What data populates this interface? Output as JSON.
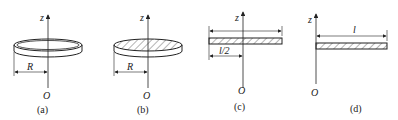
{
  "figures": [
    {
      "id": "a",
      "caption": "(a)",
      "object": "thin ring",
      "axis_label": "z",
      "origin_label": "O",
      "dimension_label": "R"
    },
    {
      "id": "b",
      "caption": "(b)",
      "object": "solid disk",
      "axis_label": "z",
      "origin_label": "O",
      "dimension_label": "R"
    },
    {
      "id": "c",
      "caption": "(c)",
      "object": "thin rod rotated about center",
      "axis_label": "z",
      "origin_label": "O",
      "dimension_label": "l/2"
    },
    {
      "id": "d",
      "caption": "(d)",
      "object": "thin rod rotated about end",
      "axis_label": "z",
      "origin_label": "O",
      "dimension_label": "l"
    }
  ],
  "colors": {
    "line": "#222222",
    "background": "#ffffff"
  }
}
